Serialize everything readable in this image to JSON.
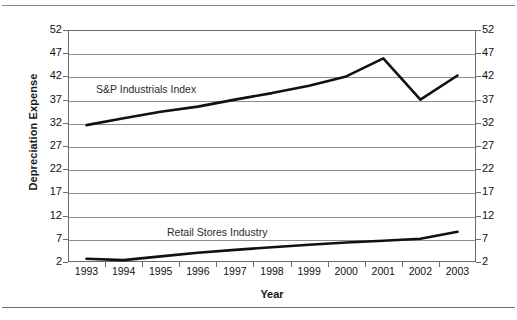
{
  "figure": {
    "top_rule": "horizontal-rule",
    "bottom_rule": "horizontal-rule"
  },
  "chart_data": {
    "type": "line",
    "title": "",
    "xlabel": "Year",
    "ylabel": "Depreciation Expense",
    "categories": [
      "1993",
      "1994",
      "1995",
      "1996",
      "1997",
      "1998",
      "1999",
      "2000",
      "2001",
      "2002",
      "2003"
    ],
    "ylim": [
      2,
      52
    ],
    "ytick_step": 5,
    "yticks": [
      2,
      7,
      12,
      17,
      22,
      27,
      32,
      37,
      42,
      47,
      52
    ],
    "ytick_labels_left": [
      "52",
      "47",
      "42",
      "37",
      "32",
      "27",
      "22",
      "17",
      "12",
      "7",
      "2"
    ],
    "ytick_labels_right": [
      "52",
      "47",
      "42",
      "37",
      "32",
      "27",
      "22",
      "17",
      "12",
      "7",
      "2"
    ],
    "grid": true,
    "grid_axis": "y",
    "legend_position": "inline-labels",
    "series": [
      {
        "name": "S&P Industrials Index",
        "color": "#111111",
        "values": [
          31.5,
          33.0,
          34.4,
          35.5,
          37.0,
          38.4,
          40.0,
          42.0,
          45.9,
          37.0,
          42.2
        ]
      },
      {
        "name": "Retail Stores Industry",
        "color": "#111111",
        "values": [
          2.7,
          2.4,
          3.2,
          4.0,
          4.6,
          5.2,
          5.7,
          6.2,
          6.6,
          7.0,
          8.5
        ]
      }
    ],
    "annotations": [
      {
        "text": "S&P Industrials Index",
        "series": "S&P Industrials Index"
      },
      {
        "text": "Retail Stores Industry",
        "series": "Retail Stores Industry"
      }
    ]
  }
}
